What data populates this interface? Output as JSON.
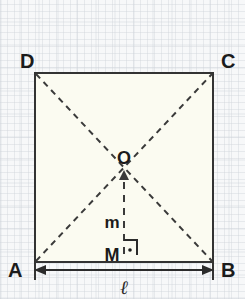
{
  "figure": {
    "kind": "geometry-diagram",
    "shape": "square",
    "colors": {
      "background": "#f7f8f9",
      "square_fill": "#fbfbf1",
      "stroke": "#333333",
      "dashed_stroke": "#3a3a3a",
      "text": "#1b1b1b"
    },
    "vertices": [
      {
        "name": "D",
        "label": "D",
        "corner": "top-left",
        "x": 35,
        "y": 73
      },
      {
        "name": "C",
        "label": "C",
        "corner": "top-right",
        "x": 213,
        "y": 73
      },
      {
        "name": "A",
        "label": "A",
        "corner": "bottom-left",
        "x": 35,
        "y": 262
      },
      {
        "name": "B",
        "label": "B",
        "corner": "bottom-right",
        "x": 213,
        "y": 262
      }
    ],
    "vertex_label_positions": [
      {
        "label": "D",
        "x": 20,
        "y": 68
      },
      {
        "label": "C",
        "x": 221,
        "y": 68
      },
      {
        "label": "A",
        "x": 8,
        "y": 277
      },
      {
        "label": "B",
        "x": 221,
        "y": 277
      }
    ],
    "points": [
      {
        "name": "O",
        "label": "O",
        "role": "center-diagonal-intersection",
        "x": 124,
        "y": 158
      },
      {
        "name": "M",
        "label": "M",
        "role": "midpoint-of-side-AB",
        "x": 124,
        "y": 254
      }
    ],
    "segments": [
      {
        "name": "apothem",
        "label": "m",
        "style": "dashed",
        "from": "M",
        "to": "O",
        "arrow": "to-O",
        "label_x": 112,
        "label_y": 222
      }
    ],
    "diagonals": [
      {
        "from": "A",
        "to": "C",
        "style": "dashed"
      },
      {
        "from": "D",
        "to": "B",
        "style": "dashed"
      }
    ],
    "right_angle": {
      "at": "M",
      "marker": "square-with-dot"
    },
    "dimension": {
      "name": "side-length",
      "label": "ℓ",
      "from": "A",
      "to": "B",
      "line_y": 270,
      "label_x": 124,
      "label_y": 294
    }
  }
}
